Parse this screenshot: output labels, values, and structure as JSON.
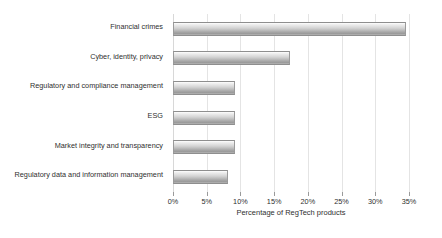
{
  "chart_data": {
    "type": "bar",
    "orientation": "horizontal",
    "title": "",
    "xlabel": "Percentage of RegTech products",
    "ylabel": "",
    "xlim": [
      0,
      35
    ],
    "xtick_labels": [
      "0%",
      "5%",
      "10%",
      "15%",
      "20%",
      "25%",
      "30%",
      "35%"
    ],
    "xticks": [
      0,
      5,
      10,
      15,
      20,
      25,
      30,
      35
    ],
    "grid": true,
    "legend": false,
    "categories": [
      "Financial crimes",
      "Cyber, identity, privacy",
      "Regulatory and compliance management",
      "ESG",
      "Market integrity and transparency",
      "Regulatory data and information management"
    ],
    "values": [
      34.5,
      17.3,
      9.2,
      9.2,
      9.2,
      8.1
    ],
    "bar_color": "#bdbdbd",
    "bar_edge_color": "#8e8e8e",
    "grid_color": "#e4e4e4"
  },
  "axis": {
    "ticks": [
      {
        "label": "0%",
        "value": 0
      },
      {
        "label": "5%",
        "value": 5
      },
      {
        "label": "10%",
        "value": 10
      },
      {
        "label": "15%",
        "value": 15
      },
      {
        "label": "20%",
        "value": 20
      },
      {
        "label": "25%",
        "value": 25
      },
      {
        "label": "30%",
        "value": 30
      },
      {
        "label": "35%",
        "value": 35
      }
    ],
    "title": "Percentage of RegTech products"
  }
}
